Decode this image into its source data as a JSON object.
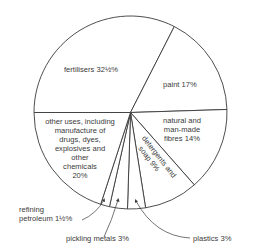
{
  "chart_data": {
    "type": "pie",
    "title": "",
    "slices": [
      {
        "label": "fertilisers",
        "value": 32.5,
        "display": "fertilisers 32½%"
      },
      {
        "label": "paint",
        "value": 17,
        "display": "paint 17%"
      },
      {
        "label": "natural and man-made fibres",
        "value": 14,
        "display": "natural and man-made fibres 14%"
      },
      {
        "label": "detergents and soap",
        "value": 9,
        "display": "detergents and soap 9%"
      },
      {
        "label": "plastics",
        "value": 3,
        "display": "plastics 3%"
      },
      {
        "label": "pickling metals",
        "value": 3,
        "display": "pickling metals 3%"
      },
      {
        "label": "refining petroleum",
        "value": 1.5,
        "display": "refining petroleum 1½%"
      },
      {
        "label": "other uses, including manufacture of drugs, dyes, explosives and other chemicals",
        "value": 20,
        "display": "other uses, including manufacture of drugs, dyes, explosives and other chemicals 20%"
      }
    ],
    "start_angle_deg": 180,
    "direction": "clockwise",
    "colors": {
      "stroke": "#3a3a3a",
      "fill": "#ffffff",
      "text": "#3a3a3a"
    }
  },
  "labels": {
    "fertilisers": "fertilisers 32½%",
    "paint": "paint 17%",
    "fibres": [
      "natural and",
      "man-made",
      "fibres 14%"
    ],
    "detergents": [
      "detergents and",
      "soap 9%"
    ],
    "other": [
      "other uses, including",
      "manufacture of",
      "drugs, dyes,",
      "explosives and",
      "other",
      "chemicals",
      "20%"
    ],
    "refining": [
      "refining",
      "petroleum 1½%"
    ],
    "pickling": "pickling metals 3%",
    "plastics": "plastics 3%"
  }
}
